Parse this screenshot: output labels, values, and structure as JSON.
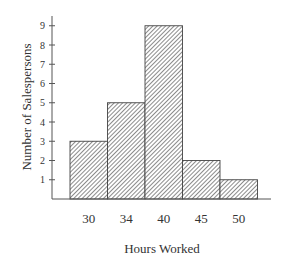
{
  "chart_data": {
    "type": "bar",
    "subtype": "histogram",
    "title": "",
    "xlabel": "Hours Worked",
    "ylabel": "Number of Salespersons",
    "categories": [
      "30",
      "34",
      "40",
      "45",
      "50"
    ],
    "values": [
      3,
      5,
      9,
      2,
      1
    ],
    "yticks": [
      1,
      2,
      3,
      4,
      5,
      6,
      7,
      8,
      9
    ],
    "ylim": [
      0,
      9.5
    ],
    "grid": false,
    "legend": null,
    "fill": "diagonal-hatch",
    "colors": {
      "bar_stroke": "#444444",
      "hatch": "#555555",
      "axis": "#555555",
      "text": "#333333"
    }
  },
  "axes": {
    "xlabel": "Hours Worked",
    "ylabel": "Number of Salespersons"
  }
}
